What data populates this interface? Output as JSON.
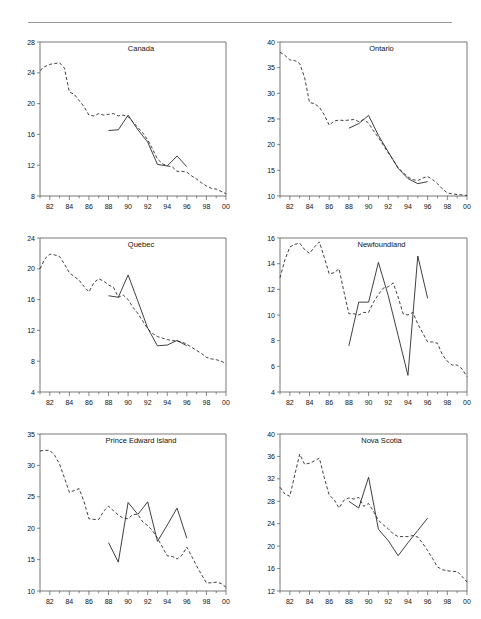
{
  "figure": {
    "panel_order": [
      "canada",
      "ontario",
      "quebec",
      "newfoundland",
      "pei",
      "nova_scotia"
    ],
    "x_tick_labels": [
      "82",
      "84",
      "86",
      "88",
      "90",
      "92",
      "94",
      "96",
      "98",
      "00"
    ],
    "x_minor_years": [
      81,
      82,
      83,
      84,
      85,
      86,
      87,
      88,
      89,
      90,
      91,
      92,
      93,
      94,
      95,
      96,
      97,
      98,
      99,
      100
    ],
    "colors": {
      "line": "#2a2a2a",
      "axis": "#555555",
      "rule": "#9a9a9a",
      "text": "#111111"
    }
  },
  "chart_data": [
    {
      "type": "line",
      "title": "Canada",
      "xlabel": "",
      "ylabel": "",
      "xlim": [
        81,
        100
      ],
      "ylim": [
        8,
        28
      ],
      "yticks": [
        8,
        12,
        16,
        20,
        24,
        28
      ],
      "xticks": [
        82,
        84,
        86,
        88,
        90,
        92,
        94,
        96,
        98,
        100
      ],
      "xticklabels": [
        "82",
        "84",
        "86",
        "88",
        "90",
        "92",
        "94",
        "96",
        "98",
        "00"
      ],
      "grid": false,
      "legend": "none",
      "series": [
        {
          "name": "dashed",
          "style": "dashed",
          "x": [
            81,
            81.5,
            82,
            82.5,
            83,
            83.5,
            84,
            84.5,
            85,
            85.5,
            86,
            86.5,
            87,
            87.5,
            88,
            88.5,
            89,
            89.5,
            90,
            90.5,
            91,
            91.5,
            92,
            92.5,
            93,
            93.5,
            94,
            94.5,
            95,
            95.5,
            96,
            96.5,
            97,
            97.5,
            98,
            98.5,
            99,
            99.5,
            100
          ],
          "values": [
            24.3,
            24.8,
            25.1,
            25.2,
            25.3,
            24.6,
            21.5,
            21.2,
            20.4,
            19.6,
            18.5,
            18.4,
            18.7,
            18.5,
            18.6,
            18.7,
            18.4,
            18.5,
            18.3,
            17.6,
            16.9,
            16.2,
            15.3,
            14.1,
            12.8,
            12.2,
            11.9,
            11.8,
            11.2,
            11.2,
            11.1,
            10.6,
            10.2,
            9.7,
            9.3,
            9.0,
            8.9,
            8.6,
            8.3
          ]
        },
        {
          "name": "solid",
          "style": "solid",
          "x": [
            88,
            89,
            90,
            91,
            92,
            93,
            94,
            95,
            96
          ],
          "values": [
            16.5,
            16.6,
            18.5,
            16.6,
            15.0,
            12.1,
            11.9,
            13.2,
            11.8
          ]
        }
      ]
    },
    {
      "type": "line",
      "title": "Ontario",
      "xlabel": "",
      "ylabel": "",
      "xlim": [
        81,
        100
      ],
      "ylim": [
        10,
        40
      ],
      "yticks": [
        10,
        15,
        20,
        25,
        30,
        35,
        40
      ],
      "xticks": [
        82,
        84,
        86,
        88,
        90,
        92,
        94,
        96,
        98,
        100
      ],
      "xticklabels": [
        "82",
        "84",
        "86",
        "88",
        "90",
        "92",
        "94",
        "96",
        "98",
        "00"
      ],
      "grid": false,
      "legend": "none",
      "series": [
        {
          "name": "dashed",
          "style": "dashed",
          "x": [
            81,
            81.5,
            82,
            82.5,
            83,
            83.5,
            84,
            84.5,
            85,
            85.5,
            86,
            86.5,
            87,
            87.5,
            88,
            88.5,
            89,
            89.5,
            90,
            90.5,
            91,
            91.5,
            92,
            92.5,
            93,
            93.5,
            94,
            94.5,
            95,
            95.5,
            96,
            96.5,
            97,
            97.5,
            98,
            98.5,
            99,
            99.5,
            100
          ],
          "values": [
            38.0,
            37.4,
            36.5,
            36.4,
            35.8,
            33.1,
            28.2,
            28.0,
            27.3,
            25.8,
            23.8,
            24.6,
            24.8,
            24.7,
            24.8,
            24.9,
            24.5,
            24.9,
            24.2,
            22.7,
            21.4,
            19.9,
            18.4,
            17.0,
            15.5,
            14.6,
            13.7,
            13.2,
            13.0,
            13.5,
            13.8,
            13.2,
            12.4,
            11.4,
            10.6,
            10.4,
            10.3,
            10.2,
            10.1
          ]
        },
        {
          "name": "solid",
          "style": "solid",
          "x": [
            88,
            89,
            90,
            91,
            92,
            93,
            94,
            95,
            96
          ],
          "values": [
            23.2,
            24.1,
            25.7,
            21.8,
            18.6,
            15.4,
            13.4,
            12.4,
            12.8
          ]
        }
      ]
    },
    {
      "type": "line",
      "title": "Quebec",
      "xlabel": "",
      "ylabel": "",
      "xlim": [
        81,
        100
      ],
      "ylim": [
        4,
        24
      ],
      "yticks": [
        4,
        8,
        12,
        16,
        20,
        24
      ],
      "xticks": [
        82,
        84,
        86,
        88,
        90,
        92,
        94,
        96,
        98,
        100
      ],
      "xticklabels": [
        "82",
        "84",
        "86",
        "88",
        "90",
        "92",
        "94",
        "96",
        "98",
        "00"
      ],
      "grid": false,
      "legend": "none",
      "series": [
        {
          "name": "dashed",
          "style": "dashed",
          "x": [
            81,
            81.5,
            82,
            82.5,
            83,
            83.5,
            84,
            84.5,
            85,
            85.5,
            86,
            86.5,
            87,
            87.5,
            88,
            88.5,
            89,
            89.5,
            90,
            90.5,
            91,
            91.5,
            92,
            92.5,
            93,
            93.5,
            94,
            94.5,
            95,
            95.5,
            96,
            96.5,
            97,
            97.5,
            98,
            98.5,
            99,
            99.5,
            100
          ],
          "values": [
            20.0,
            21.3,
            21.9,
            21.8,
            21.6,
            20.6,
            19.5,
            19.0,
            18.5,
            17.7,
            17.0,
            18.2,
            18.7,
            18.4,
            17.9,
            17.6,
            16.3,
            16.6,
            16.0,
            15.0,
            14.2,
            13.2,
            12.2,
            11.6,
            11.2,
            11.0,
            10.8,
            10.7,
            10.6,
            10.5,
            10.2,
            9.8,
            9.4,
            9.0,
            8.5,
            8.3,
            8.2,
            8.0,
            7.7
          ]
        },
        {
          "name": "solid",
          "style": "solid",
          "x": [
            88,
            89,
            90,
            91,
            92,
            93,
            94,
            95,
            96
          ],
          "values": [
            16.5,
            16.3,
            19.2,
            15.8,
            12.3,
            10.0,
            10.1,
            10.7,
            10.0
          ]
        }
      ]
    },
    {
      "type": "line",
      "title": "Newfoundland",
      "xlabel": "",
      "ylabel": "",
      "xlim": [
        81,
        100
      ],
      "ylim": [
        4,
        16
      ],
      "yticks": [
        4,
        6,
        8,
        10,
        12,
        14,
        16
      ],
      "xticks": [
        82,
        84,
        86,
        88,
        90,
        92,
        94,
        96,
        98,
        100
      ],
      "xticklabels": [
        "82",
        "84",
        "86",
        "88",
        "90",
        "92",
        "94",
        "96",
        "98",
        "00"
      ],
      "grid": false,
      "legend": "none",
      "series": [
        {
          "name": "dashed",
          "style": "dashed",
          "x": [
            81,
            81.5,
            82,
            82.5,
            83,
            83.5,
            84,
            84.5,
            85,
            85.5,
            86,
            86.5,
            87,
            87.5,
            88,
            88.5,
            89,
            89.5,
            90,
            90.5,
            91,
            91.5,
            92,
            92.5,
            93,
            93.5,
            94,
            94.5,
            95,
            95.5,
            96,
            96.5,
            97,
            97.5,
            98,
            98.5,
            99,
            99.5,
            100
          ],
          "values": [
            12.9,
            14.3,
            15.3,
            15.5,
            15.6,
            15.1,
            14.8,
            15.3,
            15.7,
            14.5,
            13.2,
            13.3,
            13.6,
            11.8,
            10.1,
            10.1,
            10.0,
            10.2,
            10.2,
            11.0,
            11.6,
            12.1,
            12.2,
            12.5,
            11.4,
            10.1,
            10.0,
            10.2,
            9.3,
            8.6,
            7.9,
            7.9,
            7.8,
            6.9,
            6.4,
            6.1,
            6.1,
            5.8,
            5.2
          ]
        },
        {
          "name": "solid",
          "style": "solid",
          "x": [
            88,
            89,
            90,
            91,
            92,
            93,
            94,
            95,
            96
          ],
          "values": [
            7.6,
            11.0,
            11.0,
            14.1,
            11.5,
            8.4,
            5.3,
            14.6,
            11.3
          ]
        }
      ]
    },
    {
      "type": "line",
      "title": "Prince Edward Island",
      "xlabel": "",
      "ylabel": "",
      "xlim": [
        81,
        100
      ],
      "ylim": [
        10,
        35
      ],
      "yticks": [
        10,
        15,
        20,
        25,
        30,
        35
      ],
      "xticks": [
        82,
        84,
        86,
        88,
        90,
        92,
        94,
        96,
        98,
        100
      ],
      "xticklabels": [
        "82",
        "84",
        "86",
        "88",
        "90",
        "92",
        "94",
        "96",
        "98",
        "00"
      ],
      "grid": false,
      "legend": "none",
      "series": [
        {
          "name": "dashed",
          "style": "dashed",
          "x": [
            81,
            81.5,
            82,
            82.5,
            83,
            83.5,
            84,
            84.5,
            85,
            85.5,
            86,
            86.5,
            87,
            87.5,
            88,
            88.5,
            89,
            89.5,
            90,
            90.5,
            91,
            91.5,
            92,
            92.5,
            93,
            93.5,
            94,
            94.5,
            95,
            95.5,
            96,
            96.5,
            97,
            97.5,
            98,
            98.5,
            99,
            99.5,
            100
          ],
          "values": [
            32.3,
            32.4,
            32.4,
            31.6,
            30.2,
            28.0,
            25.7,
            26.0,
            26.3,
            24.2,
            21.5,
            21.4,
            21.4,
            22.7,
            23.5,
            22.8,
            22.1,
            21.6,
            21.5,
            22.2,
            22.2,
            21.0,
            20.4,
            19.6,
            18.4,
            17.0,
            15.6,
            15.5,
            15.1,
            15.7,
            17.0,
            15.5,
            14.0,
            12.6,
            11.3,
            11.3,
            11.4,
            11.2,
            10.6
          ]
        },
        {
          "name": "solid",
          "style": "solid",
          "x": [
            88,
            89,
            90,
            91,
            92,
            93,
            94,
            95,
            96
          ],
          "values": [
            17.7,
            14.6,
            24.1,
            22.2,
            24.2,
            17.9,
            20.5,
            23.2,
            18.4
          ]
        }
      ]
    },
    {
      "type": "line",
      "title": "Nova Scotia",
      "xlabel": "",
      "ylabel": "",
      "xlim": [
        81,
        100
      ],
      "ylim": [
        12,
        40
      ],
      "yticks": [
        12,
        16,
        20,
        24,
        28,
        32,
        36,
        40
      ],
      "xticks": [
        82,
        84,
        86,
        88,
        90,
        92,
        94,
        96,
        98,
        100
      ],
      "xticklabels": [
        "82",
        "84",
        "86",
        "88",
        "90",
        "92",
        "94",
        "96",
        "98",
        "00"
      ],
      "grid": false,
      "legend": "none",
      "series": [
        {
          "name": "dashed",
          "style": "dashed",
          "x": [
            81,
            81.5,
            82,
            82.5,
            83,
            83.5,
            84,
            84.5,
            85,
            85.5,
            86,
            86.5,
            87,
            87.5,
            88,
            88.5,
            89,
            89.5,
            90,
            90.5,
            91,
            91.5,
            92,
            92.5,
            93,
            93.5,
            94,
            94.5,
            95,
            95.5,
            96,
            96.5,
            97,
            97.5,
            98,
            98.5,
            99,
            99.5,
            100
          ],
          "values": [
            30.5,
            29.3,
            28.9,
            32.7,
            36.4,
            34.6,
            34.8,
            35.2,
            35.7,
            32.2,
            29.1,
            28.3,
            26.8,
            28.2,
            28.6,
            28.4,
            28.7,
            27.1,
            27.6,
            26.2,
            24.6,
            23.8,
            23.1,
            22.2,
            21.7,
            21.7,
            21.7,
            21.9,
            21.6,
            20.5,
            19.2,
            17.8,
            16.3,
            15.8,
            15.6,
            15.5,
            15.5,
            14.6,
            13.6
          ]
        },
        {
          "name": "solid",
          "style": "solid",
          "x": [
            88,
            89,
            90,
            91,
            92,
            93,
            94,
            95,
            96
          ],
          "values": [
            28.0,
            26.8,
            32.3,
            23.0,
            21.0,
            18.3,
            20.6,
            22.8,
            25.0
          ]
        }
      ]
    }
  ]
}
